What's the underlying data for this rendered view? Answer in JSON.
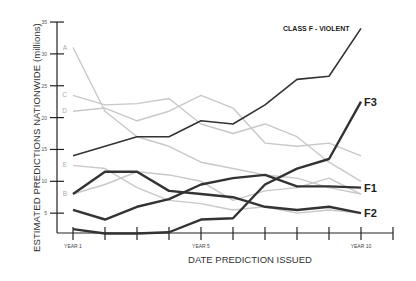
{
  "chart_data": {
    "type": "line",
    "title": "CLASS F - VIOLENT",
    "xlabel": "DATE PREDICTION ISSUED",
    "ylabel": "ESTIMATED PREDICTIONS NATIONWIDE (millions)",
    "ylim": [
      0,
      35
    ],
    "yticks": [
      5,
      10,
      15,
      20,
      25,
      30,
      35
    ],
    "x": [
      1,
      2,
      3,
      4,
      5,
      6,
      7,
      8,
      9,
      10
    ],
    "xtick_labels": {
      "1": "YEAR 1",
      "5": "YEAR 5",
      "10": "YEAR 10"
    },
    "grid": false,
    "series": [
      {
        "name": "A",
        "style": "light",
        "values": [
          31,
          21,
          17,
          15.5,
          13,
          12,
          11,
          10.5,
          9,
          8
        ]
      },
      {
        "name": "C",
        "style": "light",
        "values": [
          23.5,
          22,
          22.2,
          23,
          19,
          17.5,
          19,
          17,
          13,
          10
        ]
      },
      {
        "name": "D",
        "style": "light",
        "values": [
          21,
          21.5,
          19.5,
          21,
          23.5,
          21.5,
          16,
          15.5,
          16,
          14
        ]
      },
      {
        "name": "E",
        "style": "light",
        "values": [
          12.5,
          12,
          9,
          7,
          6.5,
          5.5,
          6,
          5,
          5.5,
          5
        ]
      },
      {
        "name": "B",
        "style": "light",
        "values": [
          8,
          9.5,
          11.5,
          11,
          10,
          7,
          8.5,
          9,
          10.5,
          8
        ]
      },
      {
        "name": "Class F - Violent",
        "style": "dark",
        "values": [
          14,
          15.5,
          17,
          17,
          19.5,
          19,
          22,
          26,
          26.5,
          34
        ]
      },
      {
        "name": "F3",
        "style": "dark-bold",
        "values": [
          2.5,
          1.8,
          1.8,
          2,
          4,
          4.2,
          9.5,
          12,
          13.5,
          22.5
        ]
      },
      {
        "name": "F2",
        "style": "dark-bold",
        "values": [
          8,
          11.5,
          11.5,
          8.5,
          8,
          7.5,
          6,
          5.5,
          6,
          5
        ]
      },
      {
        "name": "F1",
        "style": "dark-bold",
        "values": [
          5.5,
          4,
          6,
          7.2,
          9.5,
          10.5,
          11,
          9.2,
          9.2,
          9
        ]
      }
    ],
    "annotations": [
      "A",
      "B",
      "C",
      "D",
      "E",
      "F1",
      "F2",
      "F3",
      "CLASS F - VIOLENT"
    ]
  },
  "labels": {
    "title": "CLASS F - VIOLENT",
    "xlabel": "DATE PREDICTION ISSUED",
    "ylabel": "ESTIMATED PREDICTIONS NATIONWIDE (millions)"
  },
  "colors": {
    "light": "#c8c8c8",
    "dark": "#333333",
    "axis": "#222222"
  }
}
